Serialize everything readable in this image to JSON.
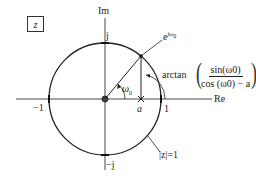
{
  "plane_label": "z",
  "axes": {
    "imag_label": "Im",
    "real_label": "Re"
  },
  "ticks": {
    "pos_j": "j",
    "neg_j": "−j",
    "neg_one": "−1",
    "one": "1"
  },
  "point": {
    "label_base": "e",
    "label_exp": "jω",
    "label_exp_sub": "0"
  },
  "angle": {
    "symbol": "ω",
    "sub": "0"
  },
  "pole": {
    "label": "a",
    "marker": "×"
  },
  "arctan_expr": {
    "func": "arctan",
    "numerator": "sin(ω0)",
    "denominator": "cos (ω0) − a"
  },
  "unit_circle_label": "|z|=1",
  "colors": {
    "stroke": "#222222",
    "background": "#ffffff"
  }
}
